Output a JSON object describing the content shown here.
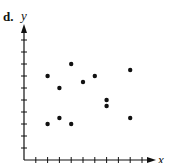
{
  "panel_label": "d.",
  "chart_data": {
    "type": "scatter",
    "title": "",
    "xlabel": "x",
    "ylabel": "y",
    "xlim": [
      0,
      10
    ],
    "ylim": [
      0,
      11
    ],
    "x_ticks": [
      1,
      2,
      3,
      4,
      5,
      6,
      7,
      8,
      9,
      10
    ],
    "y_ticks": [
      1,
      2,
      3,
      4,
      5,
      6,
      7,
      8,
      9,
      10
    ],
    "tick_labels_shown": false,
    "grid": false,
    "legend": null,
    "points": [
      {
        "x": 2,
        "y": 7
      },
      {
        "x": 2,
        "y": 3
      },
      {
        "x": 3,
        "y": 6
      },
      {
        "x": 3,
        "y": 3.5
      },
      {
        "x": 4,
        "y": 8
      },
      {
        "x": 4,
        "y": 3
      },
      {
        "x": 5,
        "y": 6.5
      },
      {
        "x": 6,
        "y": 7
      },
      {
        "x": 7,
        "y": 5
      },
      {
        "x": 7,
        "y": 4.5
      },
      {
        "x": 9,
        "y": 7.5
      },
      {
        "x": 9,
        "y": 3.5
      }
    ]
  },
  "colors": {
    "ink": "#111111",
    "background": "#ffffff"
  }
}
